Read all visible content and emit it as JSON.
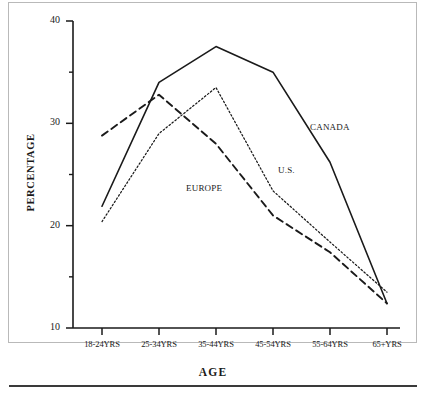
{
  "chart_data": {
    "type": "line",
    "title": "",
    "xlabel": "AGE",
    "ylabel": "PERCENTAGE",
    "categories": [
      "18-24YRS",
      "25-34YRS",
      "35-44YRS",
      "45-54YRS",
      "55-64YRS",
      "65+YRS"
    ],
    "ylim": [
      10,
      40
    ],
    "yticks": [
      10,
      20,
      30,
      40
    ],
    "ytick_labels": [
      "10",
      "20",
      "30",
      "40"
    ],
    "minor_yticks": [
      15,
      25,
      35
    ],
    "grid": false,
    "legend_position": "inline-annotations",
    "series": [
      {
        "name": "CANADA",
        "style": "solid",
        "values": [
          21.9,
          34.0,
          37.5,
          35.0,
          26.2,
          12.4
        ],
        "label_x": 310,
        "label_y": 122
      },
      {
        "name": "U.S.",
        "style": "dotted",
        "values": [
          20.4,
          29.0,
          33.5,
          23.4,
          18.4,
          13.5
        ],
        "label_x": 278,
        "label_y": 165
      },
      {
        "name": "EUROPE",
        "style": "dashed",
        "values": [
          28.8,
          32.8,
          28.0,
          21.0,
          17.4,
          12.4
        ],
        "label_x": 186,
        "label_y": 183
      }
    ]
  },
  "axis": {
    "y_title": "PERCENTAGE",
    "x_title": "AGE"
  },
  "colors": {
    "ink": "#1a1a1a",
    "axis": "#1a1a1a",
    "background": "#ffffff",
    "frame": "#b9b9b9",
    "rule": "#3a3a3a"
  }
}
